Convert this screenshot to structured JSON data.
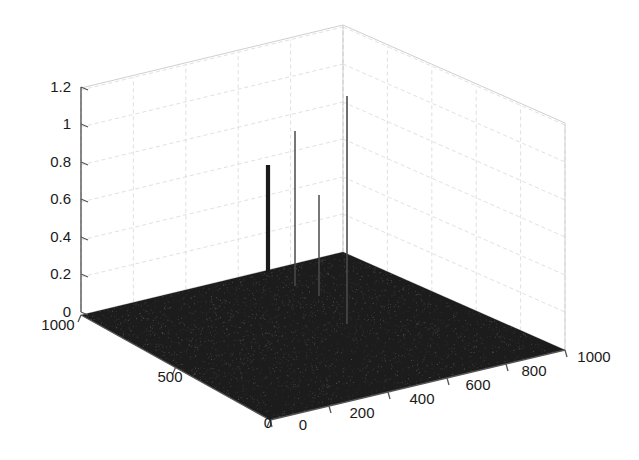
{
  "figure": {
    "background_color": "#ffffff",
    "axis_line_color": "#555555",
    "grid_color": "#d8d8d8",
    "surface_color": "#1c1c1c",
    "stem_color": "#2a2a2a",
    "tick_font_size": 15
  },
  "chart_data": {
    "type": "scatter",
    "title": "",
    "subtitle": "",
    "xlabel": "",
    "ylabel": "",
    "zlabel": "",
    "projection": "3d",
    "grid": true,
    "legend": null,
    "xlim": [
      0,
      1000
    ],
    "ylim": [
      0,
      1000
    ],
    "zlim": [
      0,
      1.2
    ],
    "xticks": [
      0,
      200,
      400,
      600,
      800,
      1000
    ],
    "yticks": [
      0,
      500,
      1000
    ],
    "zticks": [
      0,
      0.2,
      0.4,
      0.6,
      0.8,
      1,
      1.2
    ],
    "xtick_labels": [
      "0",
      "200",
      "400",
      "600",
      "800",
      "1000"
    ],
    "ytick_labels": [
      "0",
      "500",
      "1000"
    ],
    "ztick_labels": [
      "0",
      "0.2",
      "0.4",
      "0.6",
      "0.8",
      "1",
      "1.2"
    ],
    "noise_floor_level": 0.0,
    "series": [
      {
        "name": "peaks",
        "points": [
          {
            "label": "peak-1",
            "x": 170,
            "y": 290,
            "z": 0.79
          },
          {
            "label": "peak-2",
            "x": 330,
            "y": 430,
            "z": 0.97
          },
          {
            "label": "peak-3",
            "x": 300,
            "y": 230,
            "z": 0.63
          },
          {
            "label": "peak-4",
            "x": 520,
            "y": 430,
            "z": 1.15
          }
        ]
      }
    ]
  },
  "axes": {
    "z": {
      "name": "z-axis",
      "ticks": [
        {
          "value": "1.2",
          "px": 87
        },
        {
          "value": "1",
          "px": 124
        },
        {
          "value": "0.8",
          "px": 162
        },
        {
          "value": "0.6",
          "px": 199
        },
        {
          "value": "0.4",
          "px": 237
        },
        {
          "value": "0.2",
          "px": 274
        },
        {
          "value": "0",
          "px": 312
        }
      ]
    },
    "y": {
      "name": "y-axis",
      "ticks": [
        {
          "value": "1000",
          "x": 58,
          "y": 330
        },
        {
          "value": "500",
          "x": 170,
          "y": 382
        },
        {
          "value": "0",
          "x": 268,
          "y": 428
        }
      ]
    },
    "x": {
      "name": "x-axis",
      "ticks": [
        {
          "value": "0",
          "x": 303,
          "y": 430
        },
        {
          "value": "200",
          "x": 362,
          "y": 418
        },
        {
          "value": "400",
          "x": 422,
          "y": 404
        },
        {
          "value": "600",
          "x": 478,
          "y": 390
        },
        {
          "value": "800",
          "x": 534,
          "y": 376
        },
        {
          "value": "1000",
          "x": 594,
          "y": 362
        }
      ]
    }
  },
  "geometry": {
    "floor_corner_left": [
      81,
      315
    ],
    "floor_corner_back": [
      343,
      252
    ],
    "floor_corner_right": [
      565,
      350
    ],
    "floor_corner_front": [
      270,
      420
    ],
    "box_top_left": [
      81,
      88
    ],
    "box_top_back": [
      343,
      25
    ],
    "box_top_right": [
      565,
      123
    ],
    "stems": [
      {
        "name": "stem-1",
        "x": 268,
        "base_y": 272,
        "top_y": 165,
        "width": 4.2,
        "color": "#1a1a1a"
      },
      {
        "name": "stem-2",
        "x": 295,
        "base_y": 286,
        "top_y": 131,
        "width": 1.5,
        "color": "#4a4a4a"
      },
      {
        "name": "stem-3",
        "x": 319,
        "base_y": 296,
        "top_y": 195,
        "width": 1.5,
        "color": "#4a4a4a"
      },
      {
        "name": "stem-4",
        "x": 347,
        "base_y": 324,
        "top_y": 96,
        "width": 1.6,
        "color": "#4a4a4a"
      }
    ]
  }
}
